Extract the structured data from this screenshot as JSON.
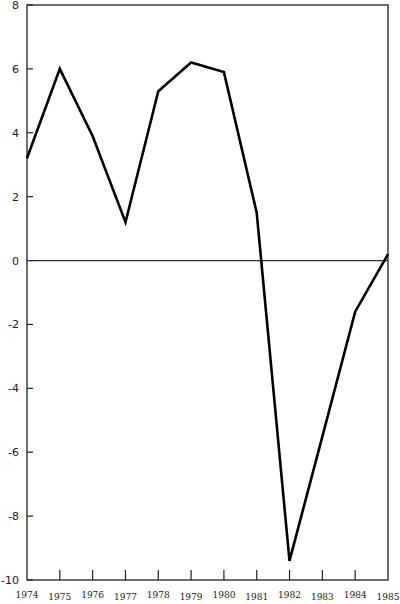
{
  "chart_data": {
    "type": "line",
    "title": "",
    "xlabel": "",
    "ylabel": "",
    "x": [
      "1974",
      "1975",
      "1976",
      "1977",
      "1978",
      "1979",
      "1980",
      "1981",
      "1982",
      "1983",
      "1984",
      "1985"
    ],
    "series": [
      {
        "name": "",
        "values": [
          3.2,
          6.0,
          3.9,
          1.2,
          5.3,
          6.2,
          5.9,
          1.5,
          -9.4,
          -5.5,
          -1.6,
          0.2
        ]
      }
    ],
    "ylim": [
      -10,
      8
    ],
    "yticks": [
      8,
      6,
      4,
      2,
      0,
      -2,
      -4,
      -6,
      -8,
      -10
    ],
    "ytick_labels": [
      "8",
      "6",
      "4",
      "2",
      "0",
      "-2",
      "-4",
      "-6",
      "-8",
      "-10"
    ],
    "grid": false,
    "zero_line": true,
    "legend": null,
    "colors": {
      "line": "#000000",
      "axis": "#222222",
      "zero_line": "#333333"
    }
  }
}
